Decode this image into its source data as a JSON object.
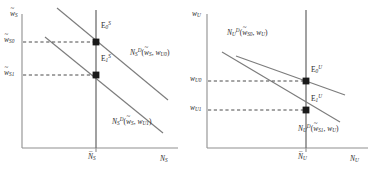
{
  "figure": {
    "type": "economics-labor-market-diagram",
    "panels": [
      {
        "id": "skilled",
        "axes": {
          "y_label": {
            "base": "w",
            "accent": "tilde",
            "sub": "S"
          },
          "x_label": {
            "base": "N",
            "sub": "S"
          },
          "origin_px": [
            22,
            148
          ],
          "x_axis_end_px": [
            178,
            148
          ],
          "y_axis_top_px": [
            22,
            14
          ]
        },
        "supply_line": {
          "label": {
            "base": "N",
            "accent": "bar",
            "sub": "S"
          },
          "x_px": 96,
          "y_top_px": 10,
          "y_bottom_px": 148
        },
        "demand_curves": [
          {
            "id": "D0",
            "label_text": "N_S^D(w~_S, w_U0)",
            "label_px": [
              131,
              48
            ],
            "p1_px": [
              57,
              8
            ],
            "p2_px": [
              168,
              100
            ]
          },
          {
            "id": "D1",
            "label_text": "N_S^D(w~_S, w_U1)",
            "label_px": [
              113,
              117
            ],
            "p1_px": [
              45,
              37
            ],
            "p2_px": [
              163,
              133
            ]
          }
        ],
        "equilibria": [
          {
            "id": "E0",
            "label_text": "E_0^S",
            "point_px": [
              96,
              42
            ],
            "label_px": [
              101,
              18
            ],
            "wage_label_px": [
              6,
              36
            ],
            "wage": {
              "base": "w",
              "accent": "tilde",
              "sub": "S0"
            }
          },
          {
            "id": "E1",
            "label_text": "E_1^S",
            "point_px": [
              96,
              75
            ],
            "label_px": [
              101,
              52
            ],
            "wage_label_px": [
              6,
              69
            ],
            "wage": {
              "base": "w",
              "accent": "tilde",
              "sub": "S1"
            }
          }
        ]
      },
      {
        "id": "unskilled",
        "axes": {
          "y_label": {
            "base": "w",
            "sub": "U"
          },
          "x_label": {
            "base": "N",
            "sub": "U"
          },
          "origin_px": [
            17,
            148
          ],
          "x_axis_end_px": [
            178,
            148
          ],
          "y_axis_top_px": [
            17,
            14
          ]
        },
        "supply_line": {
          "label": {
            "base": "N",
            "accent": "bar",
            "sub": "U"
          },
          "x_px": 116,
          "y_top_px": 10,
          "y_bottom_px": 148
        },
        "demand_curves": [
          {
            "id": "D0",
            "label_text": "N_U^D(w~_S0, w_U)",
            "label_px": [
              38,
              28
            ],
            "p1_px": [
              46,
              56
            ],
            "p2_px": [
              155,
              95
            ]
          },
          {
            "id": "D1",
            "label_text": "N_U^D(w~_S1, w_U)",
            "label_px": [
              109,
              124
            ],
            "p1_px": [
              32,
              52
            ],
            "p2_px": [
              150,
              122
            ]
          }
        ],
        "equilibria": [
          {
            "id": "E0",
            "label_text": "E_0^U",
            "point_px": [
              116,
              81
            ],
            "label_px": [
              121,
              62
            ],
            "wage_label_px": [
              2,
              75
            ],
            "wage": {
              "base": "w",
              "sub": "U0"
            }
          },
          {
            "id": "E1",
            "label_text": "E_1^U",
            "point_px": [
              116,
              110
            ],
            "label_px": [
              121,
              92
            ],
            "wage_label_px": [
              2,
              104
            ],
            "wage": {
              "base": "w",
              "sub": "U1"
            }
          }
        ]
      }
    ],
    "text": {
      "w": "w",
      "N": "N",
      "E": "E",
      "D": "D",
      "S": "S",
      "U": "U",
      "S0": "S0",
      "S1": "S1",
      "U0": "U0",
      "U1": "U1",
      "zero": "0",
      "one": "1",
      "tilde": "~",
      "bar": "–",
      "comma": ",",
      "lparen": "(",
      "rparen": ")"
    },
    "colors": {
      "axis": "#8f8f8f",
      "curve": "#7c7c7c",
      "supply": "#6f6f6f",
      "dashed": "#4a4a4a",
      "point": "#1a1a1a",
      "text": "#2b2b2b",
      "background": "#ffffff"
    }
  }
}
